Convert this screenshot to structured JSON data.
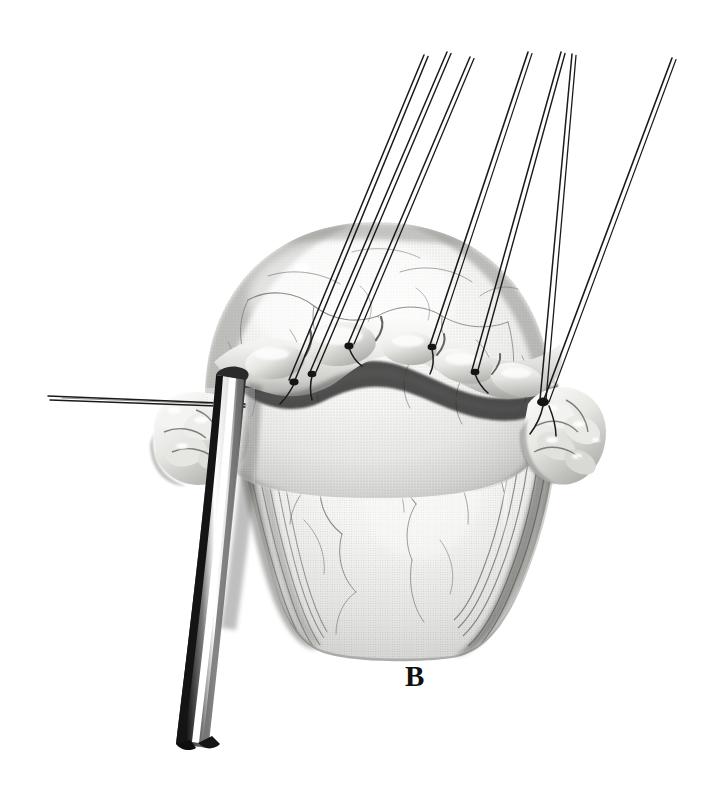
{
  "figure": {
    "panel_label": "B",
    "background_color": "#ffffff",
    "width": 709,
    "height": 794,
    "medium": "grayscale-halftone-medical-illustration"
  },
  "palette": {
    "background": "#ffffff",
    "ink_black": "#111111",
    "suture_black": "#1a1a1a",
    "tissue_highlight": "#f4f4f2",
    "tissue_light": "#e2e2e0",
    "tissue_mid": "#bdbdbb",
    "tissue_shadow": "#8e8e8c",
    "tissue_deep_shadow": "#5a5a58",
    "vessel_gray": "#6d6d6b",
    "retractor_steel_light": "#ffffff",
    "retractor_steel_dark": "#262626"
  },
  "anatomy": {
    "structures": [
      {
        "name": "cerebellar-hemisphere-dome",
        "description": "large pale dome occupying upper center, surface traced by fine branching vessels",
        "cx": 375,
        "cy": 360,
        "rx": 172,
        "ry": 148
      },
      {
        "name": "dural-edge-fold",
        "description": "thick undulating pale band crossing mid-image where tack-up sutures attach",
        "y_center": 345
      },
      {
        "name": "brainstem-body",
        "description": "shaded central mass descending below the dural edge toward the bottom of the plate",
        "cx": 380,
        "cy": 500
      },
      {
        "name": "flocculus-left-lobules",
        "description": "cluster of small rounded lobules at left margin beneath the retractor",
        "cx": 195,
        "cy": 445
      },
      {
        "name": "flocculus-right-lobules",
        "description": "cluster of small rounded lobules at right margin at the suture convergence",
        "cx": 563,
        "cy": 450
      },
      {
        "name": "dark-fiber-tracts",
        "description": "dark striated bands sweeping down on both lower flanks",
        "y_range": [
          480,
          650
        ]
      }
    ]
  },
  "instruments": {
    "ribbon_retractor": {
      "name": "ribbon-retractor",
      "description": "curved metallic ribbon retractor entering from upper left, passing over the left lobules and exiting at bottom left",
      "top_x": 222,
      "top_y": 378,
      "bottom_x": 170,
      "bottom_y": 745
    },
    "horizontal_suture": {
      "name": "horizontal-retraction-suture",
      "description": "near-horizontal suture strand running from the far left edge to the retractor",
      "left_x": 48,
      "left_y": 398,
      "right_x": 245,
      "right_y": 404
    }
  },
  "sutures": {
    "count": 7,
    "description": "tack-up sutures rising from the dural edge toward the upper right, each drawn as a fine double-filament strand",
    "strands": [
      {
        "id": "suture-1",
        "anchor_x": 289,
        "anchor_y": 380,
        "tip_x": 424,
        "tip_y": 55
      },
      {
        "id": "suture-2",
        "anchor_x": 310,
        "anchor_y": 372,
        "tip_x": 447,
        "tip_y": 52
      },
      {
        "id": "suture-3",
        "anchor_x": 348,
        "anchor_y": 344,
        "tip_x": 470,
        "tip_y": 57
      },
      {
        "id": "suture-4",
        "anchor_x": 430,
        "anchor_y": 345,
        "tip_x": 528,
        "tip_y": 52
      },
      {
        "id": "suture-5",
        "anchor_x": 472,
        "anchor_y": 370,
        "tip_x": 561,
        "tip_y": 52
      },
      {
        "id": "suture-6",
        "anchor_x": 540,
        "anchor_y": 400,
        "tip_x": 572,
        "tip_y": 54
      },
      {
        "id": "suture-7",
        "anchor_x": 543,
        "anchor_y": 402,
        "tip_x": 672,
        "tip_y": 58
      }
    ]
  }
}
